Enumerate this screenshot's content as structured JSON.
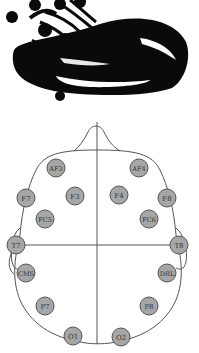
{
  "headset_image": {
    "label": "Emotiv EPOC EEG headset (photo)"
  },
  "electrode_map": {
    "outline_color": "#555555",
    "electrode_fill": "#a6a6a6",
    "electrode_stroke": "#555555",
    "label_color": "#333333",
    "electrodes": [
      {
        "label": "AF3",
        "x": 56,
        "y": 58
      },
      {
        "label": "AF4",
        "x": 139,
        "y": 58
      },
      {
        "label": "F7",
        "x": 26,
        "y": 88
      },
      {
        "label": "F3",
        "x": 75,
        "y": 86
      },
      {
        "label": "F4",
        "x": 119,
        "y": 85
      },
      {
        "label": "F8",
        "x": 167,
        "y": 88
      },
      {
        "label": "FC5",
        "x": 45,
        "y": 109
      },
      {
        "label": "FC6",
        "x": 149,
        "y": 109
      },
      {
        "label": "T7",
        "x": 16,
        "y": 135
      },
      {
        "label": "T8",
        "x": 179,
        "y": 135
      },
      {
        "label": "CMS",
        "x": 26,
        "y": 163
      },
      {
        "label": "DRL",
        "x": 167,
        "y": 163
      },
      {
        "label": "P7",
        "x": 45,
        "y": 196
      },
      {
        "label": "P8",
        "x": 149,
        "y": 196
      },
      {
        "label": "O1",
        "x": 73,
        "y": 226
      },
      {
        "label": "O2",
        "x": 121,
        "y": 227
      }
    ]
  }
}
